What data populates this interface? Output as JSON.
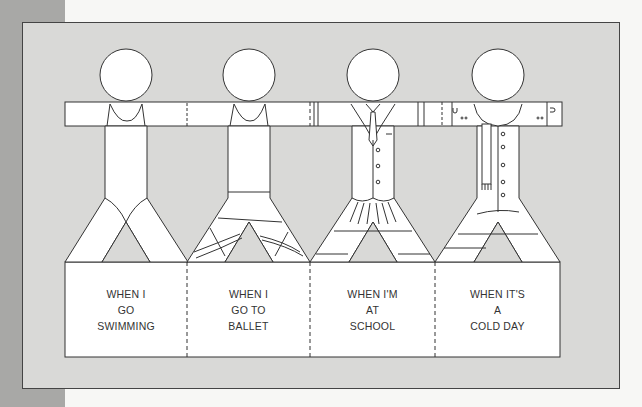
{
  "colors": {
    "page_bg": "#f7f7f5",
    "left_strip": "#a8a8a6",
    "panel_bg": "#d9d9d7",
    "figure_fill": "#ffffff",
    "line": "#333333"
  },
  "figures": [
    {
      "id": "swimming",
      "caption_lines": [
        "WHEN I",
        "GO",
        "SWIMMING"
      ]
    },
    {
      "id": "ballet",
      "caption_lines": [
        "WHEN I",
        "GO TO",
        "BALLET"
      ]
    },
    {
      "id": "school",
      "caption_lines": [
        "WHEN I'M",
        "AT",
        "SCHOOL"
      ]
    },
    {
      "id": "cold-day",
      "caption_lines": [
        "WHEN IT'S",
        "A",
        "COLD DAY"
      ]
    }
  ]
}
